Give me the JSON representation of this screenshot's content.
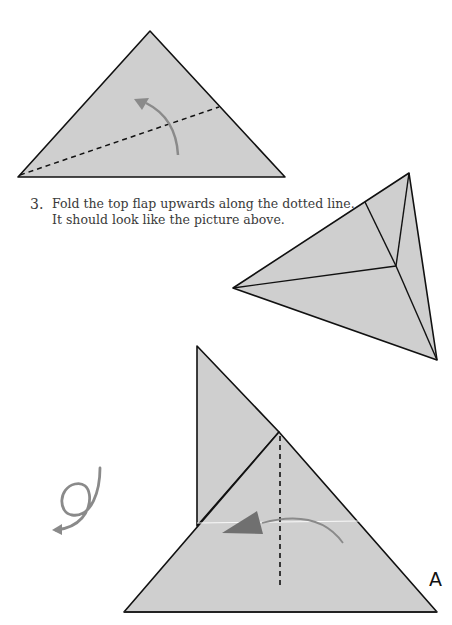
{
  "instructions": {
    "step_number": "3.",
    "line1": "Fold the top flap upwards along the dotted line.",
    "line2": "It should look like the picture above."
  },
  "labels": {
    "corner_label": "A"
  },
  "colors": {
    "paper": "#cfcfcf",
    "outline": "#111111",
    "arrow": "#8a8a8a",
    "arrow_dark": "#707070"
  },
  "diagrams": [
    {
      "name": "fold-triangle-top",
      "description": "Triangle with diagonal dashed fold line and curved arrow pointing up"
    },
    {
      "name": "folded-result",
      "description": "Folded shape result with internal crease lines"
    },
    {
      "name": "fold-triangle-bottom",
      "description": "Triangle with back flap, vertical dashed fold line and leftward arrow"
    },
    {
      "name": "turn-over-symbol",
      "description": "Looped arrow indicating turn over"
    }
  ]
}
